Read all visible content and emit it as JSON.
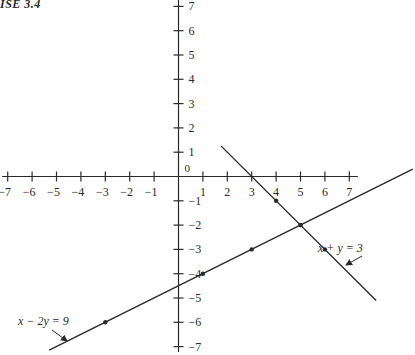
{
  "caption": "ISE 3.4",
  "colors": {
    "ink": "#2a2a2a",
    "background": "#ffffff"
  },
  "chart_data": {
    "type": "line",
    "title": "",
    "xlabel": "",
    "ylabel": "",
    "xlim": [
      -7,
      7
    ],
    "ylim": [
      -7,
      7
    ],
    "grid": false,
    "origin_label": "0",
    "x_ticks": [
      -7,
      -6,
      -5,
      -4,
      -3,
      -2,
      -1,
      1,
      2,
      3,
      4,
      5,
      6,
      7
    ],
    "y_ticks": [
      7,
      6,
      5,
      4,
      3,
      2,
      1,
      -1,
      -2,
      -3,
      -4,
      -5,
      -6,
      -7
    ],
    "series": [
      {
        "name": "x + y = 3",
        "label": "x + y = 3",
        "equation": "x + y = 3",
        "line": {
          "x": [
            1.75,
            8.1
          ],
          "y": [
            1.25,
            -5.1
          ]
        },
        "points": [
          {
            "x": 3,
            "y": 0
          },
          {
            "x": 4,
            "y": -1
          },
          {
            "x": 5,
            "y": -2
          },
          {
            "x": 6,
            "y": -3
          }
        ]
      },
      {
        "name": "x - 2y = 9",
        "label": "x − 2y = 9",
        "equation": "x - 2y = 9",
        "line": {
          "x": [
            -5.3,
            9.6
          ],
          "y": [
            -7.15,
            0.3
          ]
        },
        "points": [
          {
            "x": -3,
            "y": -6
          },
          {
            "x": 1,
            "y": -4
          },
          {
            "x": 3,
            "y": -3
          },
          {
            "x": 5,
            "y": -2
          }
        ]
      }
    ],
    "intersection": {
      "x": 5,
      "y": -2
    },
    "annotations": [
      {
        "text": "x + y = 3",
        "arrow_to": "x + y = 3 line"
      },
      {
        "text": "x − 2y = 9",
        "arrow_to": "x - 2y = 9 line"
      }
    ]
  }
}
